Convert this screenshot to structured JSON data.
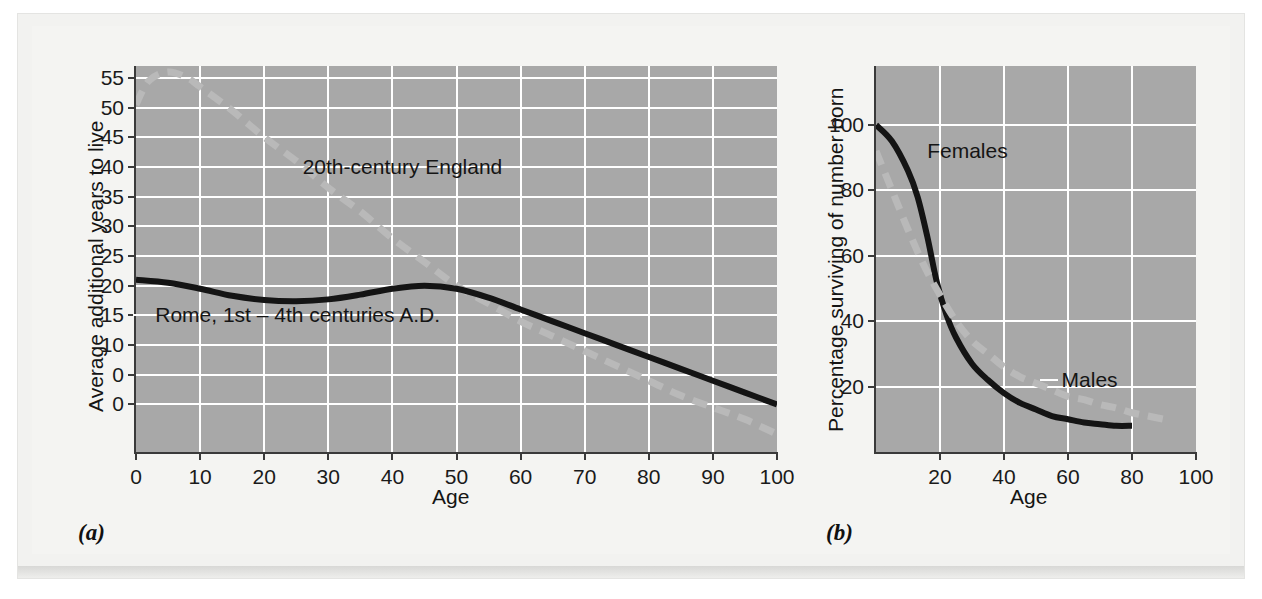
{
  "figure": {
    "background_color": "#f3f3f1",
    "plot_background_color": "#a8a8a8",
    "grid_color": "#ffffff",
    "solid_series_color": "#141414",
    "dashed_series_color": "#b9b9b9"
  },
  "panels": [
    {
      "tag": "(a)"
    },
    {
      "tag": "(b)"
    }
  ],
  "chart_data": [
    {
      "type": "line",
      "title": "",
      "xlabel": "Age",
      "ylabel": "Average additional years to live",
      "xlim": [
        0,
        100
      ],
      "ylim": [
        -8,
        57
      ],
      "xticks": [
        0,
        10,
        20,
        30,
        40,
        50,
        60,
        70,
        80,
        90,
        100
      ],
      "xticklabels": [
        "0",
        "10",
        "20",
        "30",
        "40",
        "50",
        "60",
        "70",
        "80",
        "90",
        "100"
      ],
      "yticks": [
        0,
        5,
        10,
        15,
        20,
        25,
        30,
        35,
        40,
        45,
        50,
        55
      ],
      "yticklabels": [
        "0",
        "0",
        "10",
        "15",
        "20",
        "25",
        "30",
        "35",
        "40",
        "45",
        "50",
        "55"
      ],
      "grid": true,
      "legend_position": "inline-annotation",
      "series": [
        {
          "name": "20th-century England",
          "style": "dashed",
          "color": "#b9b9b9",
          "x": [
            0,
            2,
            5,
            8,
            10,
            15,
            20,
            25,
            30,
            35,
            40,
            45,
            50,
            55,
            60,
            65,
            70,
            75,
            80,
            85,
            90,
            95,
            100
          ],
          "y": [
            50.5,
            54.5,
            56.0,
            55.0,
            53.5,
            49.5,
            45.0,
            41.0,
            36.5,
            32.5,
            28.0,
            24.0,
            20.0,
            17.0,
            14.0,
            11.5,
            9.0,
            6.5,
            4.0,
            1.5,
            -0.5,
            -2.5,
            -5.0
          ]
        },
        {
          "name": "Rome, 1st – 4th centuries A.D.",
          "style": "solid",
          "color": "#141414",
          "x": [
            0,
            5,
            10,
            15,
            20,
            25,
            30,
            35,
            40,
            45,
            50,
            55,
            60,
            65,
            70,
            75,
            80,
            85,
            90,
            95,
            100
          ],
          "y": [
            21.0,
            20.5,
            19.5,
            18.3,
            17.6,
            17.4,
            17.7,
            18.5,
            19.5,
            20.0,
            19.5,
            18.0,
            16.0,
            14.0,
            12.0,
            10.0,
            8.0,
            6.0,
            4.0,
            2.0,
            0.0
          ]
        }
      ],
      "annotations": [
        {
          "text": "20th-century England",
          "x": 26,
          "y": 40,
          "leader": true
        },
        {
          "text": "Rome, 1st – 4th centuries A.D.",
          "x": 3,
          "y": 15,
          "leader": true
        }
      ]
    },
    {
      "type": "line",
      "title": "",
      "xlabel": "Age",
      "ylabel": "Percentage surviving of number born",
      "xlim": [
        0,
        100
      ],
      "ylim": [
        0,
        118
      ],
      "xticks": [
        20,
        40,
        60,
        80,
        100
      ],
      "xticklabels": [
        "20",
        "40",
        "60",
        "80",
        "100"
      ],
      "yticks": [
        20,
        40,
        60,
        80,
        100
      ],
      "yticklabels": [
        "20",
        "40",
        "60",
        "80",
        "100"
      ],
      "grid": true,
      "legend_position": "inline-annotation",
      "series": [
        {
          "name": "Females",
          "style": "solid",
          "color": "#141414",
          "x": [
            0,
            5,
            10,
            13,
            16,
            19,
            22,
            25,
            30,
            35,
            40,
            45,
            50,
            55,
            60,
            65,
            70,
            75,
            80
          ],
          "y": [
            100,
            95,
            86,
            78,
            66,
            52,
            42,
            35,
            27,
            22,
            18,
            15,
            13,
            11,
            10,
            9,
            8.5,
            8,
            8
          ]
        },
        {
          "name": "Males",
          "style": "dashed",
          "color": "#b9b9b9",
          "x": [
            0,
            5,
            10,
            15,
            20,
            25,
            30,
            35,
            40,
            45,
            50,
            55,
            60,
            65,
            70,
            75,
            80,
            85,
            90
          ],
          "y": [
            92,
            80,
            68,
            57,
            48,
            40,
            34,
            30,
            26,
            23,
            21,
            19,
            17,
            16,
            14.5,
            13.5,
            12,
            11,
            10
          ]
        }
      ],
      "annotations": [
        {
          "text": "Females",
          "x": 16,
          "y": 92,
          "leader": false
        },
        {
          "text": "Males",
          "x": 58,
          "y": 22,
          "leader": true
        }
      ]
    }
  ]
}
